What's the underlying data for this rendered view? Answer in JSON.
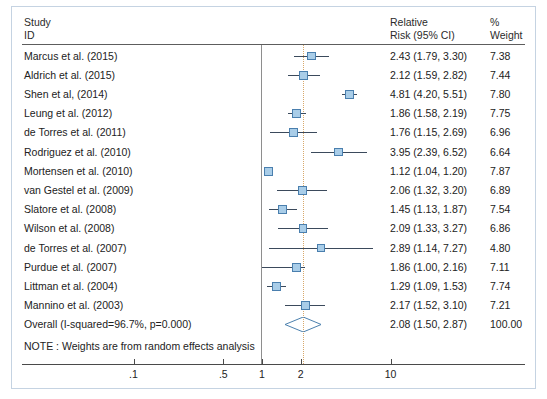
{
  "header": {
    "study_line1": "Study",
    "study_line2": "ID",
    "rr_line1": "Relative",
    "rr_line2": "Risk (95% CI)",
    "wt_line1": "%",
    "wt_line2": "Weight"
  },
  "note": "NOTE : Weights are from random effects analysis",
  "colors": {
    "marker_fill": "#a9cde8",
    "marker_border": "#4a7fae",
    "ci_line": "#3b4a5c",
    "summary_line": "#d8a86a",
    "frame": "#c5d3e2",
    "rule": "#5d5d5d"
  },
  "chart_data": {
    "type": "forest",
    "title": "",
    "xlabel": "",
    "ylabel": "",
    "xscale": "log",
    "xlim": [
      0.07,
      16
    ],
    "null_value": 1,
    "summary_line_value": 2.08,
    "grid": false,
    "axis_ticks": [
      {
        "value": 0.1,
        "label": ".1"
      },
      {
        "value": 0.5,
        "label": ".5"
      },
      {
        "value": 1,
        "label": "1"
      },
      {
        "value": 2,
        "label": "2"
      },
      {
        "value": 10,
        "label": "10"
      }
    ],
    "columns": [
      "Study ID",
      "Relative Risk (95% CI)",
      "% Weight"
    ],
    "rows": [
      {
        "study": "Marcus et al. (2015)",
        "est": 2.43,
        "lo": 1.79,
        "hi": 3.3,
        "rr_text": "2.43 (1.79, 3.30)",
        "weight": 7.38,
        "weight_text": "7.38"
      },
      {
        "study": "Aldrich et al. (2015)",
        "est": 2.12,
        "lo": 1.59,
        "hi": 2.82,
        "rr_text": "2.12 (1.59, 2.82)",
        "weight": 7.44,
        "weight_text": "7.44"
      },
      {
        "study": "Shen et al, (2014)",
        "est": 4.81,
        "lo": 4.2,
        "hi": 5.51,
        "rr_text": "4.81 (4.20, 5.51)",
        "weight": 7.8,
        "weight_text": "7.80"
      },
      {
        "study": "Leung et al. (2012)",
        "est": 1.86,
        "lo": 1.58,
        "hi": 2.19,
        "rr_text": "1.86 (1.58, 2.19)",
        "weight": 7.75,
        "weight_text": "7.75"
      },
      {
        "study": "de Torres et al. (2011)",
        "est": 1.76,
        "lo": 1.15,
        "hi": 2.69,
        "rr_text": "1.76 (1.15, 2.69)",
        "weight": 6.96,
        "weight_text": "6.96"
      },
      {
        "study": "Rodriguez et al. (2010)",
        "est": 3.95,
        "lo": 2.39,
        "hi": 6.52,
        "rr_text": "3.95 (2.39, 6.52)",
        "weight": 6.64,
        "weight_text": "6.64"
      },
      {
        "study": "Mortensen et al. (2010)",
        "est": 1.12,
        "lo": 1.04,
        "hi": 1.2,
        "rr_text": "1.12 (1.04, 1.20)",
        "weight": 7.87,
        "weight_text": "7.87"
      },
      {
        "study": "van Gestel et al. (2009)",
        "est": 2.06,
        "lo": 1.32,
        "hi": 3.2,
        "rr_text": "2.06 (1.32, 3.20)",
        "weight": 6.89,
        "weight_text": "6.89"
      },
      {
        "study": "Slatore et al. (2008)",
        "est": 1.45,
        "lo": 1.13,
        "hi": 1.87,
        "rr_text": "1.45 (1.13, 1.87)",
        "weight": 7.54,
        "weight_text": "7.54"
      },
      {
        "study": "Wilson et al. (2008)",
        "est": 2.09,
        "lo": 1.33,
        "hi": 3.27,
        "rr_text": "2.09 (1.33, 3.27)",
        "weight": 6.86,
        "weight_text": "6.86"
      },
      {
        "study": "de Torres et al. (2007)",
        "est": 2.89,
        "lo": 1.14,
        "hi": 7.27,
        "rr_text": "2.89 (1.14, 7.27)",
        "weight": 4.8,
        "weight_text": "4.80"
      },
      {
        "study": "Purdue et al. (2007)",
        "est": 1.86,
        "lo": 1.0,
        "hi": 2.16,
        "rr_text": "1.86 (1.00, 2.16)",
        "weight": 7.11,
        "weight_text": "7.11"
      },
      {
        "study": "Littman et al. (2004)",
        "est": 1.29,
        "lo": 1.09,
        "hi": 1.53,
        "rr_text": "1.29 (1.09, 1.53)",
        "weight": 7.74,
        "weight_text": "7.74"
      },
      {
        "study": "Mannino et al. (2003)",
        "est": 2.17,
        "lo": 1.52,
        "hi": 3.1,
        "rr_text": "2.17 (1.52, 3.10)",
        "weight": 7.21,
        "weight_text": "7.21"
      }
    ],
    "overall": {
      "study": "Overall (I-squared=96.7%, p=0.000)",
      "est": 2.08,
      "lo": 1.5,
      "hi": 2.87,
      "rr_text": "2.08 (1.50, 2.87)",
      "weight": 100.0,
      "weight_text": "100.00",
      "i_squared": "96.7%",
      "p_value": "0.000"
    }
  }
}
